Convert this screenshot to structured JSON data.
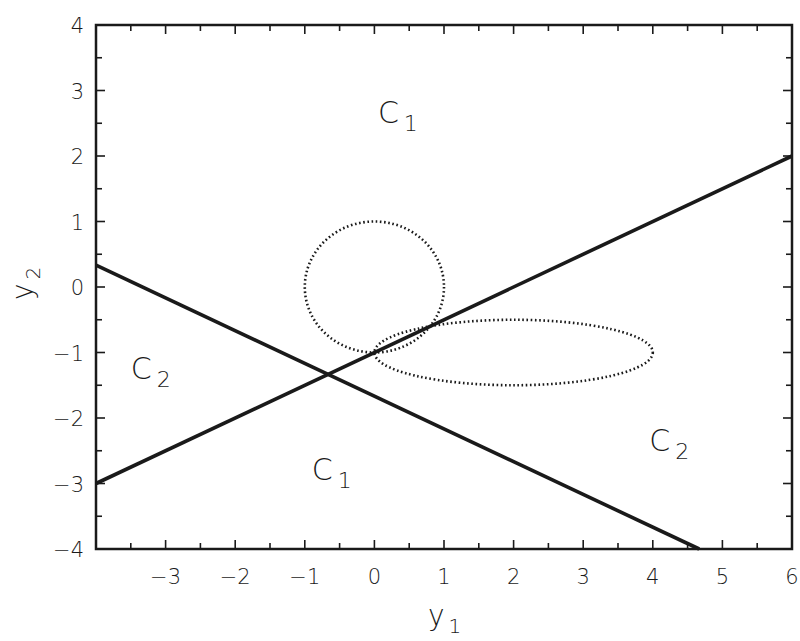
{
  "chart_data": {
    "type": "line",
    "title": "",
    "xlabel": "y1",
    "ylabel": "y2",
    "xlabel_display": {
      "base": "y",
      "sub": "1"
    },
    "ylabel_display": {
      "base": "y",
      "sub": "2"
    },
    "xlim": [
      -4,
      6
    ],
    "ylim": [
      -4,
      4
    ],
    "grid": false,
    "legend": null,
    "x_ticks": [
      -3,
      -2,
      -1,
      0,
      1,
      2,
      3,
      4,
      5,
      6
    ],
    "x_tick_labels": [
      "−3",
      "−2",
      "−1",
      "0",
      "1",
      "2",
      "3",
      "4",
      "5",
      "6"
    ],
    "y_ticks": [
      4,
      3,
      2,
      1,
      0,
      -1,
      -2,
      -3,
      -4
    ],
    "y_tick_labels": [
      "4",
      "3",
      "2",
      "1",
      "0",
      "−1",
      "−2",
      "−3",
      "−4"
    ],
    "minor_tick_step": 0.5,
    "series": [
      {
        "name": "decision-boundary-1",
        "style": "solid",
        "equation": "y2 = 0.5*y1 - 1",
        "x": [
          -4,
          6
        ],
        "y": [
          -3,
          2
        ]
      },
      {
        "name": "decision-boundary-2",
        "style": "solid",
        "equation": "y2 = -0.5*y1 - 5/3",
        "x": [
          -4,
          4.667
        ],
        "y": [
          0.333,
          -4
        ]
      },
      {
        "name": "class-1-circle",
        "style": "dotted",
        "shape": "ellipse",
        "center": [
          0,
          0
        ],
        "radii": [
          1,
          1
        ]
      },
      {
        "name": "class-2-ellipse",
        "style": "dotted",
        "shape": "ellipse",
        "center": [
          2,
          -1
        ],
        "radii": [
          2,
          0.5
        ]
      }
    ],
    "intersection": [
      -0.667,
      -1.333
    ],
    "annotations": [
      {
        "text": "C1",
        "base": "C",
        "sub": "1",
        "x": 0.05,
        "y": 2.5
      },
      {
        "text": "C1",
        "base": "C",
        "sub": "1",
        "x": -0.9,
        "y": -2.95
      },
      {
        "text": "C2",
        "base": "C",
        "sub": "2",
        "x": -3.5,
        "y": -1.4
      },
      {
        "text": "C2",
        "base": "C",
        "sub": "2",
        "x": 3.95,
        "y": -2.5
      }
    ]
  }
}
